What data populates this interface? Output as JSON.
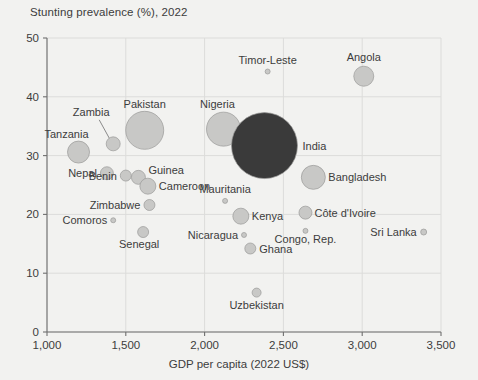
{
  "chart_data": {
    "type": "scatter",
    "title": "Stunting prevalence (%), 2022",
    "xlabel": "GDP per capita (2022 US$)",
    "ylabel": "Stunting prevalence (%), 2022",
    "xlim": [
      1000,
      3500
    ],
    "ylim": [
      0,
      50
    ],
    "xticks": [
      "1,000",
      "1,500",
      "2,000",
      "2,500",
      "3,000",
      "3,500"
    ],
    "xtick_values": [
      1000,
      1500,
      2000,
      2500,
      3000,
      3500
    ],
    "yticks": [
      "0",
      "10",
      "20",
      "30",
      "40",
      "50"
    ],
    "ytick_values": [
      0,
      10,
      20,
      30,
      40,
      50
    ],
    "grid": true,
    "legend": "none",
    "bubble_meaning": "bubble area scales with number of stunted children",
    "colors": {
      "background": "#f2f2f0",
      "bubble_default": "#c8c8c6",
      "bubble_highlight": "#3a3a3a",
      "text": "#3c3c3c",
      "grid": "#dcdcda",
      "axis": "#6f6f6f"
    },
    "points": [
      {
        "name": "Tanzania",
        "x": 1200,
        "y": 30.6,
        "r": 11.0,
        "color": "#c8c8c6",
        "label_dx": -12,
        "label_dy": -14,
        "anchor": "middle"
      },
      {
        "name": "Nepal",
        "x": 1380,
        "y": 27.0,
        "r": 6.5,
        "color": "#c8c8c6",
        "label_dx": -10,
        "label_dy": 4,
        "anchor": "end"
      },
      {
        "name": "Zambia",
        "x": 1420,
        "y": 32.0,
        "r": 7.0,
        "color": "#c8c8c6",
        "label_dx": -22,
        "label_dy": -28,
        "anchor": "middle",
        "leader": true
      },
      {
        "name": "Benin",
        "x": 1500,
        "y": 26.6,
        "r": 5.5,
        "color": "#c8c8c6",
        "label_dx": -9,
        "label_dy": 4,
        "anchor": "end"
      },
      {
        "name": "Pakistan",
        "x": 1620,
        "y": 34.3,
        "r": 19.0,
        "color": "#c8c8c6",
        "label_dx": 0,
        "label_dy": -22,
        "anchor": "middle"
      },
      {
        "name": "Guinea",
        "x": 1580,
        "y": 26.3,
        "r": 7.0,
        "color": "#c8c8c6",
        "label_dx": 10,
        "label_dy": -3,
        "anchor": "start"
      },
      {
        "name": "Cameroon",
        "x": 1640,
        "y": 24.8,
        "r": 8.0,
        "color": "#c8c8c6",
        "label_dx": 11,
        "label_dy": 4,
        "anchor": "start"
      },
      {
        "name": "Zimbabwe",
        "x": 1650,
        "y": 21.6,
        "r": 5.5,
        "color": "#c8c8c6",
        "label_dx": -9,
        "label_dy": 4,
        "anchor": "end"
      },
      {
        "name": "Comoros",
        "x": 1420,
        "y": 19.0,
        "r": 2.5,
        "color": "#c8c8c6",
        "label_dx": -6,
        "label_dy": 4,
        "anchor": "end"
      },
      {
        "name": "Senegal",
        "x": 1610,
        "y": 17.0,
        "r": 5.5,
        "color": "#c8c8c6",
        "label_dx": -4,
        "label_dy": 16,
        "anchor": "middle"
      },
      {
        "name": "Nigeria",
        "x": 2120,
        "y": 34.5,
        "r": 17.0,
        "color": "#c8c8c6",
        "label_dx": -6,
        "label_dy": -21,
        "anchor": "middle"
      },
      {
        "name": "India",
        "x": 2380,
        "y": 31.7,
        "r": 33.0,
        "color": "#3a3a3a",
        "label_dx": 38,
        "label_dy": 4,
        "anchor": "start"
      },
      {
        "name": "Mauritania",
        "x": 2130,
        "y": 22.3,
        "r": 2.5,
        "color": "#c8c8c6",
        "label_dx": 0,
        "label_dy": -8,
        "anchor": "middle"
      },
      {
        "name": "Kenya",
        "x": 2230,
        "y": 19.7,
        "r": 8.0,
        "color": "#c8c8c6",
        "label_dx": 11,
        "label_dy": 4,
        "anchor": "start"
      },
      {
        "name": "Nicaragua",
        "x": 2250,
        "y": 16.5,
        "r": 2.5,
        "color": "#c8c8c6",
        "label_dx": -6,
        "label_dy": 4,
        "anchor": "end"
      },
      {
        "name": "Ghana",
        "x": 2290,
        "y": 14.2,
        "r": 5.5,
        "color": "#c8c8c6",
        "label_dx": 9,
        "label_dy": 4,
        "anchor": "start"
      },
      {
        "name": "Uzbekistan",
        "x": 2330,
        "y": 6.7,
        "r": 4.5,
        "color": "#c8c8c6",
        "label_dx": 0,
        "label_dy": 16,
        "anchor": "middle"
      },
      {
        "name": "Timor-Leste",
        "x": 2400,
        "y": 44.3,
        "r": 2.5,
        "color": "#c8c8c6",
        "label_dx": 0,
        "label_dy": -8,
        "anchor": "middle"
      },
      {
        "name": "Côte d'Ivoire",
        "x": 2640,
        "y": 20.3,
        "r": 6.5,
        "color": "#c8c8c6",
        "label_dx": 9,
        "label_dy": 4,
        "anchor": "start"
      },
      {
        "name": "Congo, Rep.",
        "x": 2640,
        "y": 17.2,
        "r": 2.5,
        "color": "#c8c8c6",
        "label_dx": 0,
        "label_dy": 12,
        "anchor": "middle"
      },
      {
        "name": "Bangladesh",
        "x": 2690,
        "y": 26.3,
        "r": 12.0,
        "color": "#c8c8c6",
        "label_dx": 15,
        "label_dy": 4,
        "anchor": "start"
      },
      {
        "name": "Angola",
        "x": 3010,
        "y": 43.5,
        "r": 10.0,
        "color": "#c8c8c6",
        "label_dx": 0,
        "label_dy": -15,
        "anchor": "middle"
      },
      {
        "name": "Sri Lanka",
        "x": 3390,
        "y": 17.0,
        "r": 3.0,
        "color": "#c8c8c6",
        "label_dx": -7,
        "label_dy": 4,
        "anchor": "end"
      }
    ]
  }
}
